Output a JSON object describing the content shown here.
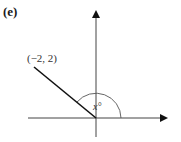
{
  "figure": {
    "panel_label": "(e)",
    "point_label": "(−2, 2)",
    "angle_label": "x°",
    "point": {
      "x": -2,
      "y": 2
    },
    "angle_degrees_approx": 135,
    "axes": {
      "x_arrow": true,
      "y_arrow": true
    },
    "colors": {
      "axis": "#444444",
      "segment": "#111111",
      "arc": "#555555"
    }
  }
}
